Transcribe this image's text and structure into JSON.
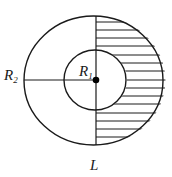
{
  "diagram": {
    "type": "concentric-circles-with-hatched-region",
    "stroke_color": "#1a1a1a",
    "background": "#ffffff",
    "outer_circle": {
      "label": "R",
      "label_sub": "2",
      "cx": 93.5,
      "cy": 80.5,
      "rx": 69.5,
      "ry": 64.5
    },
    "inner_circle": {
      "label": "R",
      "label_sub": "1",
      "cx": 95,
      "cy": 80,
      "rx": 31,
      "ry": 30
    },
    "center_point": {
      "cx": 96,
      "cy": 80
    },
    "axis_label": "L",
    "hatch_lines_y": [
      22,
      30,
      38,
      46,
      55,
      63,
      71,
      80,
      88,
      96,
      104,
      113,
      121,
      129,
      137
    ],
    "hatched_region": "right half of annulus plus area between inner and outer circles on right side"
  }
}
